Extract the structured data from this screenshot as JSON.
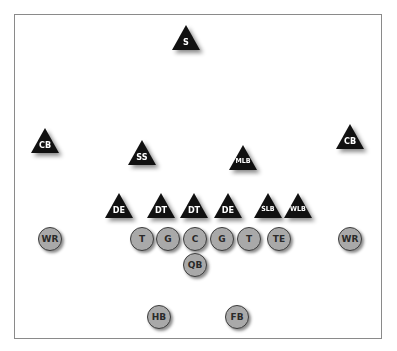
{
  "diagram": {
    "type": "football-formation",
    "colors": {
      "defense_fill": "#111111",
      "defense_text": "#ffffff",
      "offense_fill": "#a9a9a9",
      "offense_border": "#3d3d3d",
      "offense_text": "#2a2a2a",
      "border": "#8a8a8a"
    },
    "defense": [
      {
        "label": "S",
        "x": 172,
        "y": 25
      },
      {
        "label": "CB",
        "x": 31,
        "y": 128
      },
      {
        "label": "SS",
        "x": 128,
        "y": 140
      },
      {
        "label": "MLB",
        "x": 229,
        "y": 145
      },
      {
        "label": "CB",
        "x": 336,
        "y": 124
      },
      {
        "label": "DE",
        "x": 105,
        "y": 193
      },
      {
        "label": "DT",
        "x": 147,
        "y": 193
      },
      {
        "label": "DT",
        "x": 180,
        "y": 193
      },
      {
        "label": "DE",
        "x": 214,
        "y": 193
      },
      {
        "label": "SLB",
        "x": 254,
        "y": 193
      },
      {
        "label": "WLB",
        "x": 284,
        "y": 193
      }
    ],
    "offense": [
      {
        "label": "WR",
        "x": 38,
        "y": 227
      },
      {
        "label": "T",
        "x": 130,
        "y": 227
      },
      {
        "label": "G",
        "x": 156,
        "y": 227
      },
      {
        "label": "C",
        "x": 183,
        "y": 227
      },
      {
        "label": "G",
        "x": 210,
        "y": 227
      },
      {
        "label": "T",
        "x": 237,
        "y": 227
      },
      {
        "label": "TE",
        "x": 267,
        "y": 227
      },
      {
        "label": "WR",
        "x": 338,
        "y": 227
      },
      {
        "label": "QB",
        "x": 183,
        "y": 253
      },
      {
        "label": "HB",
        "x": 147,
        "y": 305
      },
      {
        "label": "FB",
        "x": 225,
        "y": 305
      }
    ]
  }
}
